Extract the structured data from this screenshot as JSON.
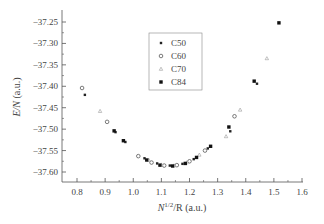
{
  "chart_data": {
    "type": "scatter",
    "title": "",
    "xlabel_main": "N",
    "xlabel_sup": "1/2",
    "xlabel_rest": "/R (a.u.)",
    "ylabel_main": "E/N",
    "ylabel_rest": " (a.u.)",
    "xlim": [
      0.75,
      1.6
    ],
    "ylim": [
      -37.62,
      -37.22
    ],
    "x_ticks": [
      0.8,
      0.9,
      1.0,
      1.1,
      1.2,
      1.3,
      1.4,
      1.5,
      1.6
    ],
    "x_tick_labels": [
      "0.8",
      "0.9",
      "1.0",
      "1.1",
      "1.2",
      "1.3",
      "1.4",
      "1.5",
      "1.6"
    ],
    "y_ticks": [
      -37.25,
      -37.3,
      -37.35,
      -37.4,
      -37.45,
      -37.5,
      -37.55,
      -37.6
    ],
    "y_tick_labels": [
      "−37.25",
      "−37.30",
      "−37.35",
      "−37.40",
      "−37.45",
      "−37.50",
      "−37.55",
      "−37.60"
    ],
    "grid": false,
    "legend_position": "top-center",
    "series": [
      {
        "name": "C50",
        "marker": "small-filled-square",
        "points": [
          [
            0.828,
            -37.42
          ],
          [
            0.937,
            -37.507
          ],
          [
            0.972,
            -37.53
          ],
          [
            1.04,
            -37.568
          ],
          [
            1.085,
            -37.58
          ],
          [
            1.13,
            -37.585
          ],
          [
            1.175,
            -37.581
          ],
          [
            1.215,
            -37.57
          ],
          [
            1.265,
            -37.545
          ],
          [
            1.345,
            -37.505
          ],
          [
            1.44,
            -37.394
          ]
        ]
      },
      {
        "name": "C60",
        "marker": "open-circle",
        "points": [
          [
            0.818,
            -37.404
          ],
          [
            0.907,
            -37.483
          ],
          [
            1.018,
            -37.563
          ],
          [
            1.065,
            -37.578
          ],
          [
            1.11,
            -37.585
          ],
          [
            1.155,
            -37.584
          ],
          [
            1.2,
            -37.575
          ],
          [
            1.255,
            -37.55
          ],
          [
            1.36,
            -37.47
          ]
        ]
      },
      {
        "name": "C70",
        "marker": "triangle",
        "points": [
          [
            0.882,
            -37.458
          ],
          [
            1.055,
            -37.572
          ],
          [
            1.1,
            -37.583
          ],
          [
            1.145,
            -37.585
          ],
          [
            1.19,
            -37.578
          ],
          [
            1.235,
            -37.56
          ],
          [
            1.33,
            -37.517
          ],
          [
            1.38,
            -37.455
          ],
          [
            1.475,
            -37.335
          ]
        ]
      },
      {
        "name": "C84",
        "marker": "filled-square",
        "points": [
          [
            0.932,
            -37.504
          ],
          [
            0.965,
            -37.527
          ],
          [
            1.048,
            -37.572
          ],
          [
            1.095,
            -37.584
          ],
          [
            1.14,
            -37.586
          ],
          [
            1.185,
            -37.58
          ],
          [
            1.225,
            -37.566
          ],
          [
            1.275,
            -37.54
          ],
          [
            1.34,
            -37.495
          ],
          [
            1.43,
            -37.388
          ],
          [
            1.518,
            -37.252
          ]
        ]
      }
    ]
  }
}
